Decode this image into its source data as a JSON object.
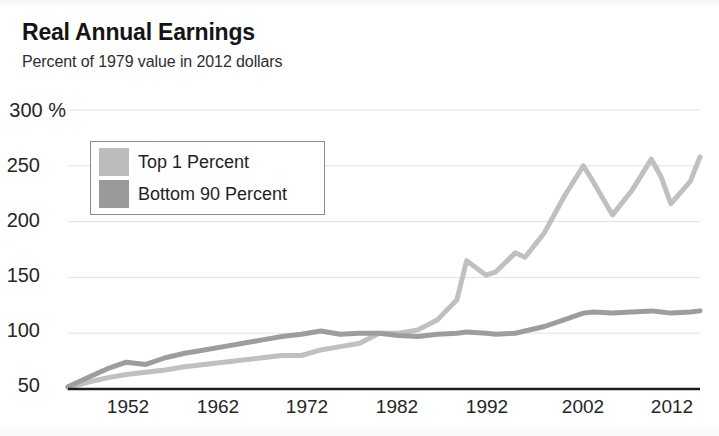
{
  "header": {
    "title": "Real Annual Earnings",
    "subtitle": "Percent of 1979 value in 2012 dollars"
  },
  "legend": {
    "items": [
      {
        "label": "Top 1 Percent",
        "color": "#bcbcbc",
        "swatch_name": "legend-swatch-top-1-percent"
      },
      {
        "label": "Bottom 90 Percent",
        "color": "#9a9a9a",
        "swatch_name": "legend-swatch-bottom-90-percent"
      }
    ]
  },
  "axes": {
    "y_ticks": [
      "300 %",
      "250",
      "200",
      "150",
      "100",
      "50"
    ],
    "x_ticks": [
      "1952",
      "1962",
      "1972",
      "1982",
      "1992",
      "2002",
      "2012"
    ]
  },
  "colors": {
    "top1_line": "#c0c0c0",
    "bottom90_line": "#9d9d9d",
    "gridline": "#e2e2e2",
    "axis": "#1c1c1c",
    "text": "#222222",
    "background": "#ffffff"
  },
  "chart_data": {
    "type": "line",
    "title": "Real Annual Earnings",
    "subtitle": "Percent of 1979 value in 2012 dollars",
    "xlabel": "",
    "ylabel": "Percent of 1979 value in 2012 dollars",
    "xlim": [
      1947,
      2012
    ],
    "ylim": [
      50,
      300
    ],
    "yticks": [
      50,
      100,
      150,
      200,
      250,
      300
    ],
    "xticks": [
      1952,
      1962,
      1972,
      1982,
      1992,
      2002,
      2012
    ],
    "grid": true,
    "legend_position": "upper-left-inside",
    "x": [
      1947,
      1949,
      1951,
      1953,
      1955,
      1957,
      1959,
      1961,
      1963,
      1965,
      1967,
      1969,
      1971,
      1973,
      1975,
      1977,
      1979,
      1981,
      1983,
      1985,
      1987,
      1988,
      1990,
      1991,
      1993,
      1994,
      1996,
      1998,
      2000,
      2001,
      2003,
      2005,
      2007,
      2008,
      2009,
      2011,
      2012
    ],
    "series": [
      {
        "name": "Top 1 Percent",
        "color": "#c0c0c0",
        "values": [
          51,
          56,
          60,
          63,
          65,
          67,
          70,
          72,
          74,
          76,
          78,
          80,
          80,
          85,
          88,
          91,
          100,
          100,
          103,
          112,
          130,
          165,
          152,
          155,
          172,
          168,
          190,
          222,
          250,
          236,
          206,
          228,
          256,
          240,
          216,
          236,
          258
        ]
      },
      {
        "name": "Bottom 90 Percent",
        "color": "#9d9d9d",
        "values": [
          52,
          60,
          68,
          74,
          72,
          78,
          82,
          85,
          88,
          91,
          94,
          97,
          99,
          102,
          99,
          100,
          100,
          98,
          97,
          99,
          100,
          101,
          100,
          99,
          100,
          102,
          106,
          112,
          118,
          119,
          118,
          119,
          120,
          119,
          118,
          119,
          120
        ]
      }
    ]
  }
}
